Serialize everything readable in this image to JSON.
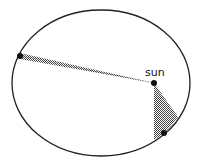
{
  "diagram": {
    "title": "",
    "sun_label": "sun",
    "colors": {
      "orbit": "#222222",
      "shading": "#555555",
      "body": "#111111",
      "background": "#ffffff"
    },
    "orbit": {
      "cx": 101,
      "cy": 83,
      "rx": 89,
      "ry": 73
    },
    "sun": {
      "x": 154,
      "y": 83
    },
    "planets": [
      {
        "name": "planet-aphelion",
        "x": 20,
        "y": 56
      },
      {
        "name": "planet-perihelion",
        "x": 164,
        "y": 133
      }
    ],
    "swept_areas": [
      {
        "name": "swept-area-far",
        "points": "154,83 20,53 20,59"
      },
      {
        "name": "swept-area-near",
        "points": "154,83 154,140 178,117"
      }
    ]
  }
}
